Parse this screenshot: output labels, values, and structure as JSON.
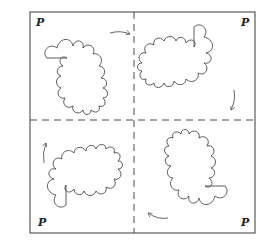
{
  "figure": {
    "corner_labels": [
      "P",
      "P",
      "P",
      "P"
    ],
    "quadrants": [
      {
        "position": "top-left",
        "label": "P",
        "arrow_direction": "right"
      },
      {
        "position": "top-right",
        "label": "P",
        "arrow_direction": "down"
      },
      {
        "position": "bottom-right",
        "label": "P",
        "arrow_direction": "left"
      },
      {
        "position": "bottom-left",
        "label": "P",
        "arrow_direction": "up"
      }
    ],
    "rotation": "clockwise"
  }
}
